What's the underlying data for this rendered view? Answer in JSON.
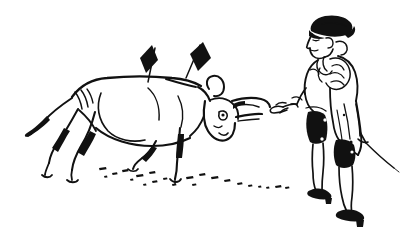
{
  "artwork": {
    "title": "Bullfight Scene",
    "medium": "pen-and-ink line drawing",
    "style": "loose cartoon sketch, black ink on white",
    "background_color": "#ffffff",
    "ink_color": "#111111",
    "caption": "A bull carrying two banderillas walks toward a matador holding a sword."
  },
  "canvas": {
    "width": 415,
    "height": 229
  },
  "figures": {
    "bull": {
      "name": "bull",
      "position": "left",
      "facing": "right",
      "parts": [
        "back",
        "belly",
        "shoulder",
        "haunch",
        "tail",
        "hind-legs",
        "front-legs",
        "hooves",
        "head",
        "ear",
        "eye",
        "muzzle",
        "horns"
      ],
      "horn_count": 2,
      "leg_count": 4
    },
    "matador": {
      "name": "matador",
      "position": "right",
      "facing": "left",
      "parts": [
        "montera-hat",
        "face",
        "pigtail",
        "jacket",
        "epaulette",
        "breeches",
        "stockings",
        "shoes",
        "left-hand",
        "right-hand",
        "sword"
      ],
      "hat_color": "#111111",
      "breeches_color": "#111111",
      "shoe_color": "#111111"
    },
    "banderillas": {
      "name": "banderillas",
      "count": 2,
      "flag_shape": "diamond",
      "flag_color": "#111111",
      "placement": "bull-shoulders"
    },
    "ground": {
      "name": "ground-line",
      "style": "dashed",
      "dash_count": 22
    }
  }
}
